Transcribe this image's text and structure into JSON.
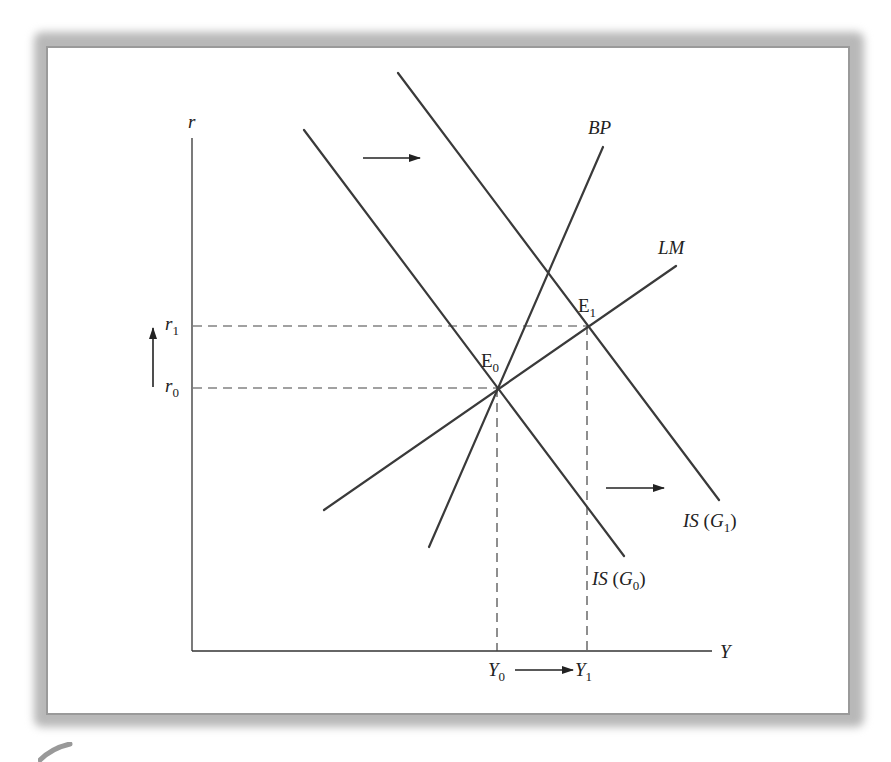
{
  "figure": {
    "type": "IS-LM-BP diagram (fiscal expansion)",
    "axes": {
      "y_label": "r",
      "x_label": "Y",
      "origin": [
        192,
        651
      ],
      "y_top": 138,
      "x_right": 712
    },
    "curves": [
      {
        "id": "IS_G0",
        "label": "IS (G",
        "sub": "0",
        "close": ")",
        "from": [
          304,
          130
        ],
        "to": [
          624,
          556
        ]
      },
      {
        "id": "IS_G1",
        "label": "IS (G",
        "sub": "1",
        "close": ")",
        "from": [
          398,
          73
        ],
        "to": [
          719,
          500
        ]
      },
      {
        "id": "BP",
        "label": "BP",
        "from": [
          429,
          547
        ],
        "to": [
          603,
          147
        ]
      },
      {
        "id": "LM",
        "label": "LM",
        "from": [
          324,
          510
        ],
        "to": [
          676,
          266
        ]
      }
    ],
    "equilibria": [
      {
        "id": "E0",
        "label": "E",
        "sub": "0",
        "point": [
          497,
          388
        ]
      },
      {
        "id": "E1",
        "label": "E",
        "sub": "1",
        "point": [
          587,
          326
        ]
      }
    ],
    "y_ticks": [
      {
        "label": "r",
        "sub": "1",
        "y": 326
      },
      {
        "label": "r",
        "sub": "0",
        "y": 388
      }
    ],
    "x_ticks": [
      {
        "label": "Y",
        "sub": "0",
        "x": 497
      },
      {
        "label": "Y",
        "sub": "1",
        "x": 587
      }
    ],
    "arrows": [
      {
        "id": "is-shift-top",
        "from": [
          363,
          158
        ],
        "to": [
          420,
          158
        ]
      },
      {
        "id": "is-shift-bottom",
        "from": [
          606,
          488
        ],
        "to": [
          664,
          488
        ]
      },
      {
        "id": "r-increase",
        "from": [
          153,
          387
        ],
        "to": [
          153,
          328
        ]
      },
      {
        "id": "y-increase",
        "from": [
          515,
          670
        ],
        "to": [
          573,
          670
        ]
      }
    ],
    "colors": {
      "line": "#3a3a3a",
      "axis": "#333333",
      "dash": "#444444",
      "frame_shadow": "#a8a8a8"
    }
  }
}
